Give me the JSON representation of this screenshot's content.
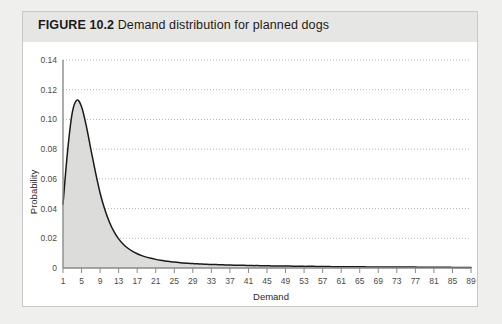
{
  "figure": {
    "label": "FIGURE 10.2",
    "caption": "Demand distribution for planned dogs"
  },
  "chart_data": {
    "type": "area",
    "title": "Demand distribution for planned dogs",
    "xlabel": "Demand",
    "ylabel": "Probability",
    "xlim": [
      1,
      89
    ],
    "ylim": [
      0,
      0.14
    ],
    "grid": true,
    "legend": null,
    "xticks": [
      1,
      5,
      9,
      13,
      17,
      21,
      25,
      29,
      33,
      37,
      41,
      45,
      49,
      53,
      57,
      61,
      65,
      69,
      73,
      77,
      81,
      85,
      89
    ],
    "yticks": [
      0,
      0.02,
      0.04,
      0.06,
      0.08,
      0.1,
      0.12,
      0.14
    ],
    "ytick_labels": [
      "0",
      "0.02",
      "0.04",
      "0.06",
      "0.08",
      "0.10",
      "0.12",
      "0.14"
    ],
    "x": [
      1,
      2,
      3,
      4,
      5,
      6,
      7,
      8,
      9,
      10,
      11,
      12,
      13,
      14,
      15,
      16,
      17,
      18,
      19,
      20,
      21,
      22,
      23,
      24,
      25,
      26,
      27,
      28,
      29,
      30,
      31,
      32,
      33,
      34,
      35,
      36,
      37,
      38,
      39,
      40,
      41,
      42,
      43,
      44,
      45,
      46,
      47,
      48,
      49,
      50,
      51,
      52,
      53,
      54,
      55,
      56,
      57,
      58,
      59,
      60,
      61,
      62,
      63,
      64,
      65,
      66,
      67,
      68,
      69,
      70,
      71,
      72,
      73,
      74,
      75,
      76,
      77,
      78,
      79,
      80,
      81,
      82,
      83,
      84,
      85,
      86,
      87,
      88,
      89
    ],
    "values": [
      0.043,
      0.079,
      0.1045,
      0.113,
      0.1085,
      0.096,
      0.08,
      0.0645,
      0.0505,
      0.0395,
      0.031,
      0.0245,
      0.0196,
      0.016,
      0.0133,
      0.0112,
      0.0096,
      0.0083,
      0.0073,
      0.0065,
      0.0058,
      0.0052,
      0.0047,
      0.0043,
      0.004,
      0.0037,
      0.0034,
      0.0032,
      0.003,
      0.0028,
      0.0027,
      0.0025,
      0.0024,
      0.0023,
      0.0022,
      0.0021,
      0.002,
      0.0019,
      0.0018,
      0.0018,
      0.0017,
      0.0016,
      0.0016,
      0.0015,
      0.0015,
      0.0014,
      0.0014,
      0.0013,
      0.0013,
      0.0013,
      0.0012,
      0.0012,
      0.0011,
      0.0011,
      0.0011,
      0.001,
      0.001,
      0.001,
      0.0009,
      0.0009,
      0.0009,
      0.0009,
      0.0008,
      0.0008,
      0.0008,
      0.0008,
      0.0007,
      0.0007,
      0.0007,
      0.0007,
      0.0007,
      0.0006,
      0.0006,
      0.0006,
      0.0006,
      0.0006,
      0.0006,
      0.0005,
      0.0005,
      0.0005,
      0.0005,
      0.0005,
      0.0005,
      0.0005,
      0.0004,
      0.0004,
      0.0004,
      0.0004,
      0.0004
    ],
    "peak": {
      "x": 4,
      "y": 0.113
    },
    "fill_color": "#dcdcda",
    "line_color": "#1a1a1a"
  }
}
